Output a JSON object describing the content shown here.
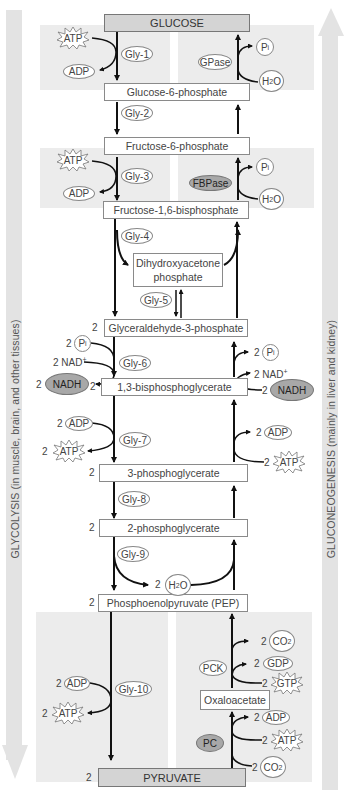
{
  "side_labels": {
    "left": "GLYCOLYSIS (in muscle, brain, and other tissues)",
    "right": "GLUCONEOGENESIS (mainly in liver and kidney)"
  },
  "metabolites": {
    "glucose": "GLUCOSE",
    "g6p": "Glucose-6-phosphate",
    "f6p": "Fructose-6-phosphate",
    "f16bp": "Fructose-1,6-bisphosphate",
    "dhap_line1": "Dihydroxyacetone",
    "dhap_line2": "phosphate",
    "gap": "Glyceraldehyde-3-phosphate",
    "bpg13": "1,3-bisphosphoglycerate",
    "pg3": "3-phosphoglycerate",
    "pg2": "2-phosphoglycerate",
    "pep": "Phosphoenolpyruvate (PEP)",
    "oaa": "Oxaloacetate",
    "pyruvate": "PYRUVATE"
  },
  "stoich": "2",
  "glycolysis_enzymes": [
    "Gly-1",
    "Gly-2",
    "Gly-3",
    "Gly-4",
    "Gly-5",
    "Gly-6",
    "Gly-7",
    "Gly-8",
    "Gly-9",
    "Gly-10"
  ],
  "gluconeogenesis_enzymes": {
    "gpase": "GPase",
    "fbpase": "FBPase",
    "pck": "PCK",
    "pc": "PC"
  },
  "cofactors": {
    "atp": "ATP",
    "adp": "ADP",
    "pi": "P",
    "pi_sub": "i",
    "h2o_h": "H",
    "h2o_sub": "2",
    "h2o_o": "O",
    "nad": "NAD",
    "nad_sup": "+",
    "nadh": "NADH",
    "co2_c": "CO",
    "co2_sub": "2",
    "gdp": "GDP",
    "gtp": "GTP"
  }
}
